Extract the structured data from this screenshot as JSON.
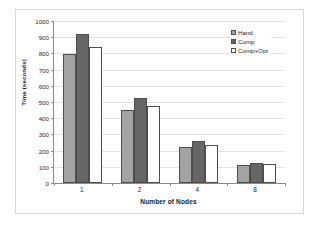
{
  "chart_data": {
    "type": "bar",
    "title": "",
    "subtitle": "",
    "xlabel": "Number of Nodes",
    "ylabel": "Time (seconds)",
    "categories": [
      "1",
      "2",
      "4",
      "8"
    ],
    "series": [
      {
        "name": "Hand",
        "values": [
          795,
          453,
          224,
          112
        ],
        "color": "#a3a3a3"
      },
      {
        "name": "Comp",
        "values": [
          920,
          522,
          261,
          122
        ],
        "color": "#666666"
      },
      {
        "name": "Comp+Opt",
        "values": [
          838,
          477,
          234,
          115
        ],
        "color": "#ffffff"
      }
    ],
    "ylim": [
      0,
      1000
    ],
    "ytick_values": [
      0,
      100,
      200,
      300,
      400,
      500,
      600,
      700,
      800,
      900,
      1000
    ],
    "ytick_labels": [
      "0",
      "100",
      "200",
      "300",
      "400",
      "500",
      "600",
      "700",
      "800",
      "900",
      "1000"
    ],
    "grid": true,
    "grid_axis": "y",
    "legend_position": "top-right",
    "legend": [
      "Hand",
      "Comp",
      "Comp+Opt"
    ],
    "bar_edge_color": "#4d4d4d",
    "axis_color": "#8a8a8a",
    "gridline_color": "#e3e3e3",
    "background_color": "#ffffff",
    "frame_color": "#d8d8d8"
  }
}
